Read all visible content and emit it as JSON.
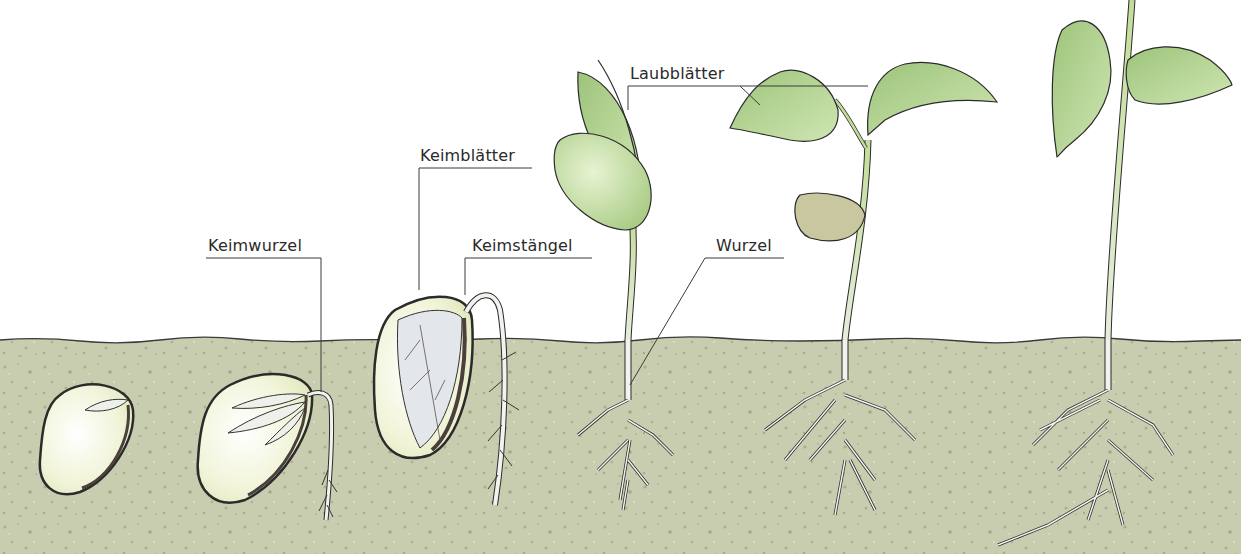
{
  "diagram": {
    "stages": [
      {
        "id": 1,
        "description": "Samen im Boden"
      },
      {
        "id": 2,
        "description": "Keimwurzel tritt aus"
      },
      {
        "id": 3,
        "description": "Keimstängel wächst nach oben"
      },
      {
        "id": 4,
        "description": "Keimblätter über dem Boden"
      },
      {
        "id": 5,
        "description": "Laubblätter entfalten sich"
      },
      {
        "id": 6,
        "description": "Junge Pflanze"
      }
    ],
    "labels": {
      "keimwurzel": "Keimwurzel",
      "keimblaetter": "Keimblätter",
      "keimstaengel": "Keimstängel",
      "laubblaetter": "Laubblätter",
      "wurzel": "Wurzel"
    },
    "colors": {
      "soil": "#c9cdb0",
      "soil_speckle": "#a9ae8c",
      "leaf": "#a8c98a",
      "leaf_light": "#d9ebc4",
      "stem": "#c7de9e",
      "seed": "#f3f5dc",
      "outline": "#2b2b2b",
      "root": "#f2f2ee"
    }
  }
}
